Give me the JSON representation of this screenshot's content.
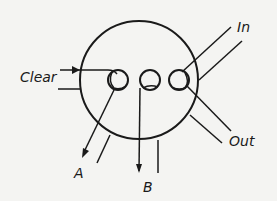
{
  "diagram": {
    "type": "valve-port-schematic",
    "labels": {
      "clear": "Clear",
      "in": "In",
      "out": "Out",
      "a": "A",
      "b": "B"
    },
    "colors": {
      "stroke": "#1a1a1a",
      "background": "#f4f4f2"
    }
  }
}
